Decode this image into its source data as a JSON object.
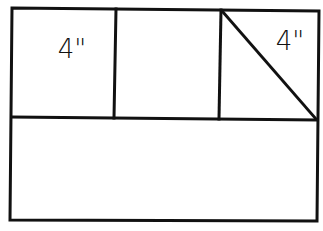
{
  "diagram": {
    "type": "quilt-block-layout",
    "stroke_color": "#111111",
    "background": "#ffffff",
    "labels": [
      {
        "id": "left-square-label",
        "text": "4\"",
        "x": 72,
        "y": 58
      },
      {
        "id": "right-triangle-label",
        "text": "4\"",
        "x": 290,
        "y": 50
      }
    ],
    "regions": [
      {
        "id": "top-left-square",
        "label": "4\""
      },
      {
        "id": "top-middle-square",
        "label": ""
      },
      {
        "id": "top-right-square-with-diagonal",
        "label": "4\""
      },
      {
        "id": "bottom-rectangle",
        "label": ""
      }
    ]
  }
}
